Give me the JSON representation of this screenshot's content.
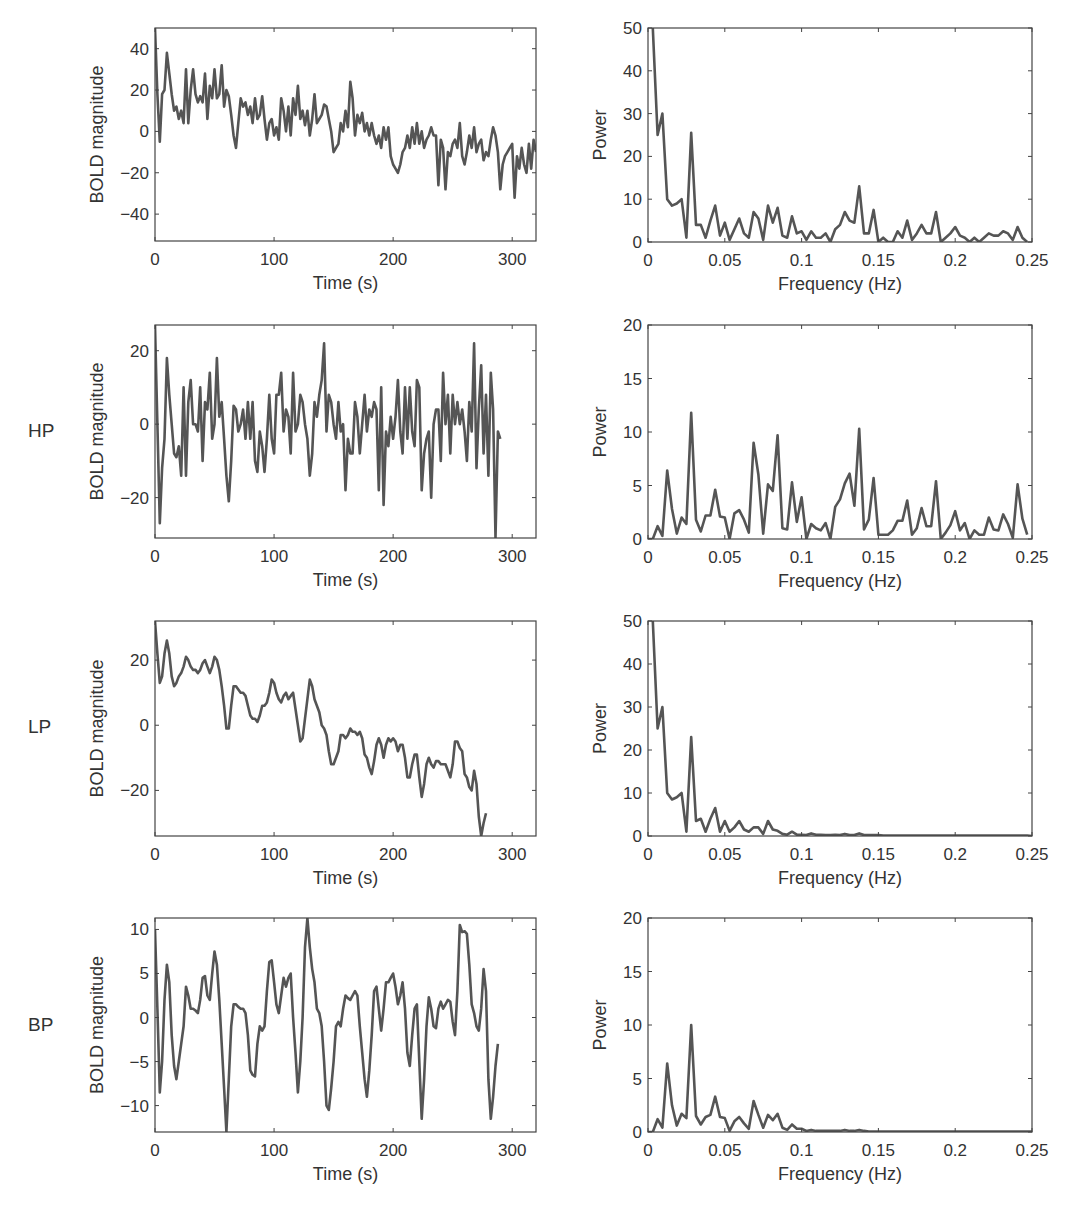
{
  "figure": {
    "line_color": "#555555",
    "axis_color": "#444444",
    "rows": [
      {
        "label": ""
      },
      {
        "label": "HP"
      },
      {
        "label": "LP"
      },
      {
        "label": "BP"
      }
    ]
  },
  "chart_data": [
    {
      "id": "raw-time",
      "type": "line",
      "row_label": "",
      "title": "",
      "xlabel": "Time (s)",
      "ylabel": "BOLD magnitude",
      "xlim": [
        0,
        320
      ],
      "ylim": [
        -53,
        50
      ],
      "xticks": [
        0,
        100,
        200,
        300
      ],
      "yticks": [
        -40,
        -20,
        0,
        20,
        40
      ],
      "grid": false,
      "x": [
        0,
        2,
        4,
        6,
        8,
        10,
        12,
        14,
        16,
        18,
        20,
        22,
        24,
        26,
        28,
        30,
        32,
        34,
        36,
        38,
        40,
        42,
        44,
        46,
        48,
        50,
        52,
        54,
        56,
        58,
        60,
        62,
        64,
        66,
        68,
        70,
        72,
        74,
        76,
        78,
        80,
        82,
        84,
        86,
        88,
        90,
        92,
        94,
        96,
        98,
        100,
        102,
        104,
        106,
        108,
        110,
        112,
        114,
        116,
        118,
        120,
        122,
        124,
        126,
        128,
        130,
        132,
        134,
        136,
        138,
        140,
        142,
        144,
        146,
        148,
        150,
        152,
        154,
        156,
        158,
        160,
        162,
        164,
        166,
        168,
        170,
        172,
        174,
        176,
        178,
        180,
        182,
        184,
        186,
        188,
        190,
        192,
        194,
        196,
        198,
        200,
        202,
        204,
        206,
        208,
        210,
        212,
        214,
        216,
        218,
        220,
        222,
        224,
        226,
        228,
        230,
        232,
        234,
        236,
        238,
        240,
        242,
        244,
        246,
        248,
        250,
        252,
        254,
        256,
        258,
        260,
        262,
        264,
        266,
        268,
        270,
        272,
        274,
        276,
        278,
        280,
        282,
        284,
        286,
        288,
        290,
        292,
        294,
        296,
        298,
        300,
        302,
        304,
        306,
        308,
        310,
        312,
        314,
        316,
        318,
        320
      ],
      "values": [
        50,
        18,
        -5,
        18,
        20,
        38,
        28,
        18,
        10,
        12,
        6,
        10,
        4,
        30,
        4,
        20,
        30,
        18,
        14,
        17,
        14,
        28,
        6,
        22,
        16,
        30,
        16,
        18,
        32,
        12,
        20,
        17,
        8,
        -2,
        -8,
        4,
        16,
        12,
        14,
        8,
        12,
        4,
        16,
        6,
        8,
        17,
        6,
        -4,
        4,
        6,
        -2,
        2,
        -4,
        16,
        10,
        0,
        12,
        -2,
        16,
        8,
        22,
        6,
        10,
        3,
        10,
        -2,
        6,
        18,
        4,
        6,
        8,
        13,
        12,
        6,
        0,
        -10,
        -8,
        -6,
        4,
        0,
        10,
        2,
        24,
        16,
        -2,
        8,
        4,
        9,
        0,
        4,
        -2,
        4,
        -2,
        -6,
        -2,
        -8,
        2,
        -4,
        2,
        -12,
        -16,
        -18,
        -20,
        -16,
        -10,
        -8,
        -2,
        -8,
        2,
        -6,
        4,
        -6,
        0,
        -8,
        -4,
        -2,
        2,
        -2,
        -2,
        -26,
        -4,
        -8,
        -28,
        -10,
        -12,
        -6,
        -4,
        -8,
        4,
        -12,
        -16,
        -10,
        -2,
        -8,
        2,
        -10,
        -6,
        -4,
        -14,
        -10,
        -12,
        -4,
        2,
        -2,
        -10,
        -28,
        -16,
        -12,
        -10,
        -8,
        -6,
        -32,
        -12,
        -18,
        -8,
        -16,
        -20,
        -6,
        -18,
        -4,
        -10,
        -10,
        -14,
        -8,
        -8,
        -10,
        -20,
        -10,
        -8,
        -4,
        0,
        2,
        8,
        -20,
        -4,
        0,
        -6,
        -10,
        -14,
        -12,
        -18,
        -22,
        -16,
        -24,
        -52,
        -26,
        -24
      ],
      "plot_box": {
        "left": 155,
        "top": 28,
        "width": 381,
        "height": 213
      }
    },
    {
      "id": "raw-spectrum",
      "type": "line",
      "row_label": "",
      "xlabel": "Frequency (Hz)",
      "ylabel": "Power",
      "xlim": [
        0,
        0.25
      ],
      "ylim": [
        0,
        50
      ],
      "xticks": [
        0,
        0.05,
        0.1,
        0.15,
        0.2,
        0.25
      ],
      "yticks": [
        0,
        10,
        20,
        30,
        40,
        50
      ],
      "grid": false,
      "x_step": 0.003125,
      "values": [
        null,
        50,
        25,
        30,
        10,
        8.5,
        9,
        10,
        1,
        25.5,
        4,
        4,
        1,
        5,
        8.5,
        1.5,
        4.5,
        0.5,
        3,
        5.5,
        2,
        1,
        7,
        5.5,
        0.5,
        8.5,
        4.5,
        8,
        1.5,
        1,
        6,
        2,
        2.5,
        0.5,
        2.5,
        1,
        1,
        2,
        0,
        3,
        4,
        7,
        5,
        4.5,
        13,
        2,
        2,
        7.5,
        0,
        1,
        0,
        0,
        2.5,
        1,
        5,
        0.5,
        2,
        4,
        2,
        2,
        7,
        0,
        1,
        2,
        3.5,
        1.5,
        1,
        0,
        1,
        0,
        1,
        2,
        1.5,
        1.5,
        2.5,
        2,
        0.5,
        3.5,
        1,
        0
      ],
      "plot_box": {
        "left": 648,
        "top": 28,
        "width": 384,
        "height": 214
      }
    },
    {
      "id": "hp-time",
      "type": "line",
      "row_label": "HP",
      "xlabel": "Time (s)",
      "ylabel": "BOLD magnitude",
      "xlim": [
        0,
        320
      ],
      "ylim": [
        -31,
        27
      ],
      "xticks": [
        0,
        100,
        200,
        300
      ],
      "yticks": [
        -20,
        0,
        20
      ],
      "grid": false,
      "x_step": 2,
      "values": [
        27,
        0,
        -27,
        -12,
        -4,
        18,
        8,
        0,
        -8,
        -9,
        -6,
        -14,
        10,
        -14,
        6,
        12,
        0,
        0,
        -2,
        10,
        -10,
        6,
        4,
        14,
        -4,
        0,
        18,
        2,
        6,
        -4,
        -14,
        -21,
        -10,
        5,
        4,
        -2,
        0,
        4,
        -4,
        6,
        -4,
        6,
        -10,
        -13,
        -2,
        -6,
        -13,
        -4,
        8,
        -4,
        -8,
        8,
        8,
        14,
        -2,
        4,
        2,
        -8,
        14,
        -2,
        0,
        8,
        6,
        0,
        -4,
        -14,
        -8,
        6,
        2,
        8,
        12,
        22,
        -2,
        8,
        6,
        0,
        -4,
        6,
        -2,
        0,
        -18,
        -4,
        -8,
        -8,
        6,
        2,
        -8,
        0,
        8,
        -2,
        4,
        2,
        6,
        4,
        -18,
        10,
        -22,
        -2,
        -6,
        2,
        -4,
        2,
        12,
        -2,
        -8,
        10,
        -4,
        10,
        -2,
        -6,
        12,
        10,
        -18,
        -8,
        -4,
        -2,
        -20,
        0,
        4,
        4,
        -10,
        14,
        0,
        8,
        -8,
        8,
        0,
        6,
        0,
        4,
        -2,
        -10,
        6,
        -2,
        22,
        -12,
        4,
        16,
        -8,
        8,
        -14,
        14,
        4,
        -31,
        -2,
        -4
      ],
      "plot_box": {
        "left": 155,
        "top": 325,
        "width": 381,
        "height": 213
      }
    },
    {
      "id": "hp-spectrum",
      "type": "line",
      "row_label": "HP",
      "xlabel": "Frequency (Hz)",
      "ylabel": "Power",
      "xlim": [
        0,
        0.25
      ],
      "ylim": [
        0,
        20
      ],
      "xticks": [
        0,
        0.05,
        0.1,
        0.15,
        0.2,
        0.25
      ],
      "yticks": [
        0,
        5,
        10,
        15,
        20
      ],
      "grid": false,
      "x_step": 0.003125,
      "values": [
        0,
        0,
        1.2,
        0.3,
        6.4,
        2.8,
        0.5,
        2,
        1.4,
        11.8,
        1.8,
        0.7,
        2.2,
        2.2,
        4.6,
        2.1,
        2,
        0,
        2.4,
        2.7,
        1.8,
        0.6,
        9,
        6,
        0.5,
        5.1,
        4.5,
        9.7,
        1,
        0.9,
        5.3,
        1.6,
        3.9,
        0,
        1.4,
        1,
        0.8,
        1.5,
        0,
        3,
        3.7,
        5.2,
        6.1,
        3.1,
        10.3,
        0.9,
        1.8,
        5.7,
        0.4,
        0.4,
        0.4,
        0.8,
        1.7,
        1.7,
        3.6,
        0.4,
        1,
        2.9,
        1.2,
        1.2,
        5.4,
        0,
        0.6,
        1.3,
        2.6,
        0.8,
        1.5,
        0,
        0.8,
        0.4,
        0.4,
        2,
        0.9,
        0.8,
        2.3,
        1.4,
        0.1,
        5.1,
        1.9,
        0.4
      ],
      "plot_box": {
        "left": 648,
        "top": 325,
        "width": 384,
        "height": 214
      }
    },
    {
      "id": "lp-time",
      "type": "line",
      "row_label": "LP",
      "xlabel": "Time (s)",
      "ylabel": "BOLD magnitude",
      "xlim": [
        0,
        320
      ],
      "ylim": [
        -34,
        32
      ],
      "xticks": [
        0,
        100,
        200,
        300
      ],
      "yticks": [
        -20,
        0,
        20
      ],
      "grid": false,
      "x_step": 2,
      "values": [
        32,
        22,
        13,
        15,
        22,
        26,
        22,
        15,
        12,
        13,
        15,
        16,
        18,
        21,
        20,
        18,
        17,
        17,
        16,
        17,
        19,
        20,
        18,
        16,
        18,
        21,
        20,
        17,
        12,
        6,
        -1,
        -1,
        6,
        12,
        12,
        11,
        10,
        10,
        9,
        6,
        3,
        2,
        2,
        1,
        3,
        6,
        6,
        7,
        10,
        14,
        13,
        10,
        8,
        7,
        9,
        10,
        8,
        9,
        10,
        5,
        0,
        -5,
        -4,
        2,
        8,
        14,
        12,
        8,
        6,
        4,
        0,
        -1,
        -3,
        -8,
        -12,
        -12,
        -10,
        -8,
        -3,
        -3,
        -4,
        -3,
        -1,
        -2,
        -2,
        -3,
        -2,
        -4,
        -9,
        -10,
        -13,
        -15,
        -11,
        -6,
        -4,
        -6,
        -10,
        -6,
        -4,
        -5,
        -4,
        -5,
        -8,
        -6,
        -6,
        -10,
        -16,
        -16,
        -12,
        -9,
        -9,
        -16,
        -22,
        -18,
        -12,
        -10,
        -12,
        -13,
        -11,
        -11,
        -12,
        -12,
        -12,
        -14,
        -16,
        -12,
        -5,
        -5,
        -7,
        -8,
        -15,
        -16,
        -19,
        -20,
        -14,
        -18,
        -28,
        -34,
        -30,
        -27
      ],
      "plot_box": {
        "left": 155,
        "top": 621,
        "width": 381,
        "height": 215
      }
    },
    {
      "id": "lp-spectrum",
      "type": "line",
      "row_label": "LP",
      "xlabel": "Frequency (Hz)",
      "ylabel": "Power",
      "xlim": [
        0,
        0.25
      ],
      "ylim": [
        0,
        50
      ],
      "xticks": [
        0,
        0.05,
        0.1,
        0.15,
        0.2,
        0.25
      ],
      "yticks": [
        0,
        10,
        20,
        30,
        40,
        50
      ],
      "grid": false,
      "x_step": 0.003125,
      "values": [
        null,
        50,
        25,
        30,
        10,
        8.5,
        9,
        10,
        1,
        23,
        3.5,
        4,
        1,
        4,
        6.5,
        1,
        3.5,
        1,
        2,
        3.5,
        1.5,
        1,
        2,
        2,
        0.5,
        3.5,
        1.5,
        1.2,
        0.5,
        0.3,
        1,
        0.3,
        0.3,
        0.2,
        0.6,
        0.3,
        0.3,
        0.2,
        0.2,
        0.3,
        0.2,
        0.5,
        0.2,
        0.2,
        0.6,
        0.2,
        0.2,
        0.2,
        0.2,
        0.1,
        0.1,
        0.1,
        0.1,
        0.1,
        0.1,
        0.1,
        0.1,
        0.1,
        0.1,
        0.1,
        0.1,
        0.1,
        0.1,
        0.1,
        0.1,
        0.1,
        0.1,
        0.1,
        0.1,
        0.1,
        0.1,
        0.1,
        0.1,
        0.1,
        0.1,
        0.1,
        0.1,
        0.1,
        0.1,
        0.1,
        0
      ],
      "plot_box": {
        "left": 648,
        "top": 621,
        "width": 384,
        "height": 215
      }
    },
    {
      "id": "bp-time",
      "type": "line",
      "row_label": "BP",
      "xlabel": "Time (s)",
      "ylabel": "BOLD magnitude",
      "xlim": [
        0,
        320
      ],
      "ylim": [
        -13,
        11.3
      ],
      "xticks": [
        0,
        100,
        200,
        300
      ],
      "yticks": [
        -10,
        -5,
        0,
        5,
        10
      ],
      "grid": false,
      "x_step": 2,
      "values": [
        10,
        1,
        -8.5,
        -5,
        2,
        6,
        4,
        -2,
        -5.5,
        -7,
        -5,
        -3,
        -1,
        3.5,
        2.5,
        1,
        1,
        0.8,
        0.5,
        2,
        4.5,
        4.7,
        2.5,
        2,
        5,
        7.5,
        6,
        2,
        -3,
        -8,
        -13,
        -7,
        -1,
        1.5,
        1.5,
        1.2,
        1,
        1,
        0.5,
        -2,
        -6,
        -6.5,
        -6.7,
        -3,
        -1,
        -1.5,
        -1,
        3,
        6.3,
        6.5,
        4,
        1.5,
        0.5,
        2.5,
        4.5,
        3.5,
        4.5,
        5,
        0,
        -4,
        -8.5,
        -5,
        0,
        8,
        11.3,
        8,
        5.5,
        4,
        1,
        0.5,
        -1,
        -5,
        -10,
        -10.5,
        -8,
        -5,
        -1,
        -0.5,
        -1,
        1,
        2.5,
        2.2,
        2,
        2.5,
        3,
        2.5,
        -1,
        -4,
        -7,
        -9,
        -6,
        -2,
        3,
        3.5,
        1,
        -1.5,
        1,
        4,
        4,
        4.5,
        5,
        3.5,
        1.5,
        2.5,
        4,
        1,
        -4,
        -5.5,
        -2,
        1,
        1.5,
        -5,
        -11.5,
        -7,
        -1,
        2.3,
        1,
        -1,
        -1.2,
        1,
        1.8,
        1,
        1.5,
        2,
        1.8,
        -0.5,
        -2,
        3,
        10.5,
        9.7,
        9.8,
        9.5,
        6,
        1.5,
        0.5,
        -1,
        -1.5,
        1,
        5.5,
        3,
        -7,
        -11.5,
        -9,
        -5.5,
        -3
      ],
      "plot_box": {
        "left": 155,
        "top": 918,
        "width": 381,
        "height": 214
      }
    },
    {
      "id": "bp-spectrum",
      "type": "line",
      "row_label": "BP",
      "xlabel": "Frequency (Hz)",
      "ylabel": "Power",
      "xlim": [
        0,
        0.25
      ],
      "ylim": [
        0,
        20
      ],
      "xticks": [
        0,
        0.05,
        0.1,
        0.15,
        0.2,
        0.25
      ],
      "yticks": [
        0,
        5,
        10,
        15,
        20
      ],
      "grid": false,
      "x_step": 0.003125,
      "values": [
        0,
        0,
        1.2,
        0.4,
        6.4,
        2.5,
        0.6,
        1.7,
        1.3,
        10,
        1.5,
        0.7,
        1.4,
        1.6,
        3.3,
        1.4,
        1.3,
        0.1,
        1,
        1.4,
        0.8,
        0.3,
        2.9,
        1.6,
        0.4,
        1.6,
        1.1,
        1.7,
        0.4,
        0.2,
        0.7,
        0.3,
        0.3,
        0.1,
        0.2,
        0.1,
        0.1,
        0.1,
        0.1,
        0.1,
        0.1,
        0.2,
        0.1,
        0.1,
        0.2,
        0.1,
        0.05,
        0.05,
        0.05,
        0.05,
        0.05,
        0.05,
        0.05,
        0.05,
        0.05,
        0.05,
        0.05,
        0.05,
        0.05,
        0.05,
        0.05,
        0.05,
        0.05,
        0.05,
        0.05,
        0.05,
        0.05,
        0.05,
        0.05,
        0.05,
        0.05,
        0.05,
        0.05,
        0.05,
        0.05,
        0.05,
        0.05,
        0.05,
        0.05,
        0.05,
        0.05
      ],
      "plot_box": {
        "left": 648,
        "top": 918,
        "width": 384,
        "height": 214
      }
    }
  ]
}
